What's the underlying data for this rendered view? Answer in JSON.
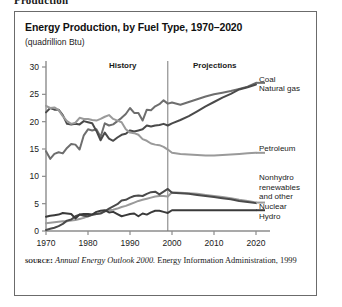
{
  "page": {
    "cut_off_caption": "Production"
  },
  "figure": {
    "title": "Energy Production, by Fuel Type, 1970–2020",
    "subtitle": "(quadrillion Btu)",
    "source": {
      "keyword": "source:",
      "italic_part": "Annual Energy Outlook 2000.",
      "rest": "Energy Information Administration, 1999"
    }
  },
  "chart_data": {
    "type": "line",
    "title": "Energy Production, by Fuel Type, 1970–2020",
    "subtitle": "(quadrillion Btu)",
    "xlabel": "",
    "ylabel": "quadrillion Btu",
    "xlim": [
      1970,
      2020
    ],
    "ylim": [
      0,
      30
    ],
    "xticks": [
      1970,
      1980,
      1990,
      2000,
      2010,
      2020
    ],
    "xtick_labels": [
      "1970",
      "1980",
      "1990",
      "2000",
      "2010",
      "2020"
    ],
    "yticks": [
      0,
      5,
      10,
      15,
      20,
      25,
      30
    ],
    "ytick_labels": [
      "0",
      "5",
      "10",
      "15",
      "20",
      "25",
      "30"
    ],
    "grid": false,
    "legend_position": "right-inline-callouts",
    "annotations": [
      {
        "text": "History",
        "x": 1981,
        "y": 29.2
      },
      {
        "text": "Projections",
        "x": 2003,
        "y": 29.2
      },
      {
        "text": "divider",
        "x": 1999,
        "y_from": 0,
        "y_to": 30
      }
    ],
    "divider_year": 1999,
    "x": [
      1970,
      1971,
      1972,
      1973,
      1974,
      1975,
      1976,
      1977,
      1978,
      1979,
      1980,
      1981,
      1982,
      1983,
      1984,
      1985,
      1986,
      1987,
      1988,
      1989,
      1990,
      1991,
      1992,
      1993,
      1994,
      1995,
      1996,
      1997,
      1998,
      1999,
      2000,
      2002,
      2004,
      2006,
      2008,
      2010,
      2012,
      2014,
      2016,
      2018,
      2020
    ],
    "series": [
      {
        "name": "Coal",
        "color": "#6e6e6e",
        "values": [
          14.6,
          13.2,
          14.1,
          14.4,
          14.2,
          15.2,
          15.9,
          15.8,
          14.9,
          17.5,
          18.6,
          18.4,
          18.6,
          17.2,
          19.7,
          19.3,
          19.5,
          20.1,
          20.7,
          21.4,
          22.5,
          21.6,
          21.6,
          20.2,
          22.2,
          22.1,
          22.8,
          23.2,
          23.9,
          23.3,
          23.5,
          23.1,
          23.6,
          24.1,
          24.6,
          25.0,
          25.3,
          25.6,
          26.0,
          26.4,
          27.1
        ]
      },
      {
        "name": "Natural gas",
        "color": "#4a4a4a",
        "values": [
          21.7,
          22.5,
          22.2,
          22.2,
          21.2,
          19.6,
          19.5,
          19.6,
          19.5,
          20.1,
          19.9,
          19.7,
          18.3,
          16.6,
          18.0,
          16.9,
          16.5,
          17.1,
          17.6,
          17.8,
          18.4,
          18.2,
          18.4,
          18.6,
          19.3,
          19.1,
          19.3,
          19.4,
          19.6,
          19.3,
          19.7,
          20.3,
          21.0,
          21.9,
          22.8,
          23.6,
          24.4,
          25.1,
          25.9,
          26.3,
          26.8
        ]
      },
      {
        "name": "Petroleum",
        "color": "#9a9a9a",
        "values": [
          22.9,
          22.5,
          22.6,
          22.1,
          21.0,
          20.1,
          19.6,
          19.8,
          20.7,
          20.5,
          20.5,
          20.3,
          20.2,
          20.5,
          20.9,
          21.2,
          20.5,
          20.2,
          19.9,
          18.6,
          18.0,
          17.9,
          17.6,
          16.8,
          16.5,
          16.0,
          15.8,
          15.7,
          15.4,
          14.9,
          14.3,
          14.1,
          14.0,
          13.9,
          13.8,
          13.8,
          13.9,
          14.0,
          14.1,
          14.2,
          14.3
        ]
      },
      {
        "name": "Nonhydro renewables and other",
        "color": "#9a9a9a",
        "values": [
          1.4,
          1.5,
          1.6,
          1.7,
          1.8,
          1.8,
          1.9,
          2.0,
          2.2,
          2.4,
          2.7,
          2.9,
          3.1,
          3.3,
          3.6,
          3.8,
          3.9,
          4.1,
          4.4,
          4.6,
          4.9,
          5.2,
          5.5,
          5.7,
          5.9,
          6.1,
          6.3,
          6.4,
          6.4,
          6.3,
          7.1,
          7.0,
          6.9,
          6.8,
          6.6,
          6.4,
          6.2,
          6.0,
          5.7,
          5.5,
          5.2
        ]
      },
      {
        "name": "Nuclear",
        "color": "#4a4a4a",
        "values": [
          0.2,
          0.4,
          0.6,
          0.9,
          1.3,
          1.9,
          2.1,
          2.7,
          3.0,
          2.8,
          2.7,
          3.0,
          3.1,
          3.2,
          3.6,
          4.1,
          4.5,
          4.9,
          5.6,
          5.7,
          6.1,
          6.4,
          6.5,
          6.4,
          6.8,
          7.1,
          7.2,
          6.7,
          7.2,
          7.7,
          7.0,
          6.9,
          6.8,
          6.6,
          6.4,
          6.2,
          6.0,
          5.8,
          5.5,
          5.3,
          5.1
        ]
      },
      {
        "name": "Hydro",
        "color": "#3a3a3a",
        "values": [
          2.6,
          2.8,
          2.9,
          3.0,
          3.3,
          3.2,
          3.1,
          2.3,
          3.0,
          3.1,
          3.1,
          3.0,
          3.5,
          3.7,
          3.8,
          3.4,
          3.5,
          3.1,
          2.7,
          2.9,
          3.1,
          3.2,
          2.7,
          3.2,
          3.0,
          3.4,
          3.7,
          3.7,
          3.5,
          3.3,
          3.8,
          3.8,
          3.8,
          3.8,
          3.8,
          3.8,
          3.8,
          3.8,
          3.8,
          3.8,
          3.8
        ]
      }
    ],
    "series_labels": [
      {
        "key": "coal",
        "text": "Coal"
      },
      {
        "key": "natural_gas",
        "text": "Natural gas"
      },
      {
        "key": "petroleum",
        "text": "Petroleum"
      },
      {
        "key": "nonhydro_1",
        "text": "Nonhydro"
      },
      {
        "key": "nonhydro_2",
        "text": "renewables"
      },
      {
        "key": "nonhydro_3",
        "text": "and other"
      },
      {
        "key": "nuclear",
        "text": "Nuclear"
      },
      {
        "key": "hydro",
        "text": "Hydro"
      }
    ]
  },
  "labels": {
    "history": "History",
    "projections": "Projections",
    "coal": "Coal",
    "natural_gas": "Natural gas",
    "petroleum": "Petroleum",
    "nonhydro_l1": "Nonhydro",
    "nonhydro_l2": "renewables",
    "nonhydro_l3": "and other",
    "nuclear": "Nuclear",
    "hydro": "Hydro"
  }
}
